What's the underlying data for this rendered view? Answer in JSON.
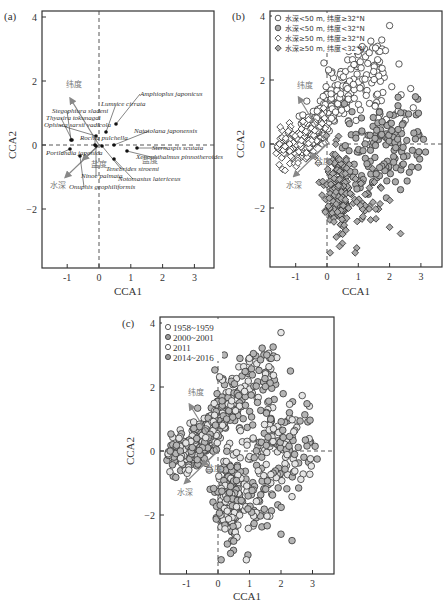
{
  "figure": {
    "panels": [
      {
        "id": "a",
        "label": "(a)",
        "xlabel": "CCA1",
        "ylabel": "CCA2",
        "xticks": [
          "-1",
          "0",
          "1",
          "2",
          "3"
        ],
        "yticks": [
          "4",
          "2",
          "0",
          "-2"
        ]
      },
      {
        "id": "b",
        "label": "(b)",
        "xlabel": "CCA1",
        "ylabel": "CCA2",
        "xticks": [
          "-1",
          "0",
          "1",
          "2",
          "3"
        ],
        "yticks": [
          "4",
          "2",
          "0",
          "-2"
        ],
        "legend": [
          "水深<50 m, 纬度≥32°N",
          "水深<50 m, 纬度<32°N",
          "水深≥50 m, 纬度≥32°N",
          "水深≥50 m, 纬度<32°N"
        ]
      },
      {
        "id": "c",
        "label": "(c)",
        "xlabel": "CCA1",
        "ylabel": "CCA2",
        "xticks": [
          "-1",
          "0",
          "1",
          "2",
          "3"
        ],
        "yticks": [
          "4",
          "2",
          "0",
          "-2"
        ],
        "legend": [
          "1958~1959",
          "2000~2001",
          "2011",
          "2014~2016"
        ]
      }
    ],
    "env_labels": {
      "latitude": "纬度",
      "depth": "水深",
      "salinity": "盐度"
    }
  },
  "chart_data": [
    {
      "type": "scatter",
      "title": "(a) CCA species biplot",
      "xlabel": "CCA1",
      "ylabel": "CCA2",
      "xlim": [
        -1.8,
        3.7
      ],
      "ylim": [
        -3.8,
        4.2
      ],
      "grid": false,
      "species": [
        {
          "name": "Amphioplus japonicus",
          "x": 0.55,
          "y": 0.62
        },
        {
          "name": "Lumbrineris cirrata",
          "label": "Lumrice cirrata",
          "x": 0.2,
          "y": 0.45
        },
        {
          "name": "Stegophiura sladeni",
          "x": -0.9,
          "y": 0.12
        },
        {
          "name": "Thyasira tokunagai",
          "x": -0.88,
          "y": 0.12
        },
        {
          "name": "Ophiura sarsii vadicola",
          "x": -0.05,
          "y": 0.3
        },
        {
          "name": "Rochia pulchella",
          "x": -0.02,
          "y": 0.02
        },
        {
          "name": "Natatolana japonensis",
          "x": 0.5,
          "y": 0.02
        },
        {
          "name": "Sternaspis scutata",
          "x": 1.2,
          "y": -0.05
        },
        {
          "name": "Portlandia japonica",
          "x": -0.9,
          "y": -0.1
        },
        {
          "name": "Xenophthalmus pinnotheroides",
          "x": 0.9,
          "y": -0.1
        },
        {
          "name": "Tenebrides stroemi",
          "x": 0.1,
          "y": 0.0
        },
        {
          "name": "Ninoe palmata",
          "x": 0.0,
          "y": 0.0
        },
        {
          "name": "Notomastus latericeus",
          "x": 0.5,
          "y": -0.4
        },
        {
          "name": "Onuphis geophiliformis",
          "x": -0.6,
          "y": -0.35
        }
      ],
      "env_vectors": [
        {
          "name": "纬度",
          "x": -0.9,
          "y": 1.45
        },
        {
          "name": "水深",
          "x": -1.05,
          "y": -1.0
        },
        {
          "name": "盐度",
          "x": -0.5,
          "y": -0.45
        }
      ]
    },
    {
      "type": "scatter",
      "title": "(b) Sites by depth/latitude group",
      "xlabel": "CCA1",
      "ylabel": "CCA2",
      "xlim": [
        -1.8,
        3.7
      ],
      "ylim": [
        -3.8,
        4.2
      ],
      "legend_position": "upper left",
      "series": [
        {
          "name": "水深<50 m, 纬度≥32°N",
          "marker": "circle-open",
          "region": "upper arm, x -0.5~2.5, y 0~4"
        },
        {
          "name": "水深<50 m, 纬度<32°N",
          "marker": "circle-gray",
          "region": "right spread, x 0.5~3.3, y -2~1.2"
        },
        {
          "name": "水深≥50 m, 纬度≥32°N",
          "marker": "diamond-open",
          "region": "left cluster, x -1.6~0.2, y -1.2~0.8"
        },
        {
          "name": "水深≥50 m, 纬度<32°N",
          "marker": "diamond-gray",
          "region": "lower arm, x 0~1.5, y -3.4~0"
        }
      ]
    },
    {
      "type": "scatter",
      "title": "(c) Sites by survey period",
      "xlabel": "CCA1",
      "ylabel": "CCA2",
      "xlim": [
        -1.8,
        3.7
      ],
      "ylim": [
        -3.8,
        4.2
      ],
      "legend_position": "upper left",
      "series": [
        {
          "name": "1958~1959",
          "marker": "circle-open"
        },
        {
          "name": "2000~2001",
          "marker": "circle-gray"
        },
        {
          "name": "2011",
          "marker": "circle-open"
        },
        {
          "name": "2014~2016",
          "marker": "circle-gray"
        }
      ]
    }
  ]
}
